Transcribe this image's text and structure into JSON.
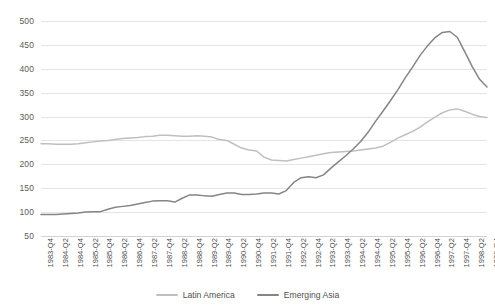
{
  "chart_data": {
    "type": "line",
    "title": "",
    "subtitle": "",
    "xlabel": "",
    "ylabel": "",
    "ylim": [
      50,
      500
    ],
    "ytick_step": 50,
    "yticks": [
      500,
      450,
      400,
      350,
      300,
      250,
      200,
      150,
      100,
      50
    ],
    "grid": true,
    "grid_axis": "y",
    "legend_position": "bottom-center",
    "x_tick_labels": [
      "1983-Q4",
      "1984-Q2",
      "1984-Q4",
      "1985-Q2",
      "1985-Q4",
      "1986-Q2",
      "1986-Q4",
      "1987-Q2",
      "1987-Q4",
      "1988-Q2",
      "1988-Q4",
      "1989-Q2",
      "1989-Q4",
      "1990-Q2",
      "1990-Q4",
      "1991-Q2",
      "1991-Q4",
      "1992-Q2",
      "1992-Q4",
      "1993-Q2",
      "1993-Q4",
      "1994-Q2",
      "1994-Q4",
      "1995-Q2",
      "1995-Q4",
      "1996-Q2",
      "1996-Q4",
      "1997-Q2",
      "1997-Q4",
      "1998-Q2",
      "1998-Q4"
    ],
    "x": [
      "1983-Q4",
      "1984-Q1",
      "1984-Q2",
      "1984-Q3",
      "1984-Q4",
      "1985-Q1",
      "1985-Q2",
      "1985-Q3",
      "1985-Q4",
      "1986-Q1",
      "1986-Q2",
      "1986-Q3",
      "1986-Q4",
      "1987-Q1",
      "1987-Q2",
      "1987-Q3",
      "1987-Q4",
      "1988-Q1",
      "1988-Q2",
      "1988-Q3",
      "1988-Q4",
      "1989-Q1",
      "1989-Q2",
      "1989-Q3",
      "1989-Q4",
      "1990-Q1",
      "1990-Q2",
      "1990-Q3",
      "1990-Q4",
      "1991-Q1",
      "1991-Q2",
      "1991-Q3",
      "1991-Q4",
      "1992-Q1",
      "1992-Q2",
      "1992-Q3",
      "1992-Q4",
      "1993-Q1",
      "1993-Q2",
      "1993-Q3",
      "1993-Q4",
      "1994-Q1",
      "1994-Q2",
      "1994-Q3",
      "1994-Q4",
      "1995-Q1",
      "1995-Q2",
      "1995-Q3",
      "1995-Q4",
      "1996-Q1",
      "1996-Q2",
      "1996-Q3",
      "1996-Q4",
      "1997-Q1",
      "1997-Q2",
      "1997-Q3",
      "1997-Q4",
      "1998-Q1",
      "1998-Q2",
      "1998-Q3",
      "1998-Q4"
    ],
    "series": [
      {
        "name": "Latin America",
        "color": "#bfbfbf",
        "values": [
          243,
          243,
          242,
          242,
          242,
          243,
          245,
          247,
          249,
          250,
          252,
          254,
          255,
          256,
          258,
          259,
          261,
          261,
          260,
          259,
          259,
          260,
          259,
          257,
          252,
          250,
          242,
          234,
          230,
          228,
          215,
          209,
          208,
          207,
          210,
          213,
          216,
          219,
          222,
          225,
          226,
          227,
          228,
          230,
          232,
          234,
          238,
          246,
          255,
          262,
          269,
          278,
          289,
          299,
          308,
          314,
          316,
          311,
          305,
          300,
          298
        ]
      },
      {
        "name": "Emerging Asia",
        "color": "#858585",
        "values": [
          95,
          95,
          95,
          96,
          97,
          98,
          100,
          101,
          101,
          106,
          110,
          112,
          114,
          117,
          120,
          123,
          124,
          124,
          121,
          129,
          136,
          136,
          134,
          133,
          137,
          140,
          140,
          137,
          137,
          138,
          140,
          140,
          138,
          145,
          162,
          172,
          174,
          172,
          178,
          192,
          205,
          218,
          232,
          248,
          267,
          290,
          311,
          333,
          356,
          381,
          404,
          428,
          448,
          465,
          476,
          478,
          466,
          436,
          405,
          378,
          362
        ]
      }
    ]
  },
  "legend": {
    "items": [
      {
        "label": "Latin America",
        "color": "#bfbfbf"
      },
      {
        "label": "Emerging Asia",
        "color": "#858585"
      }
    ]
  }
}
